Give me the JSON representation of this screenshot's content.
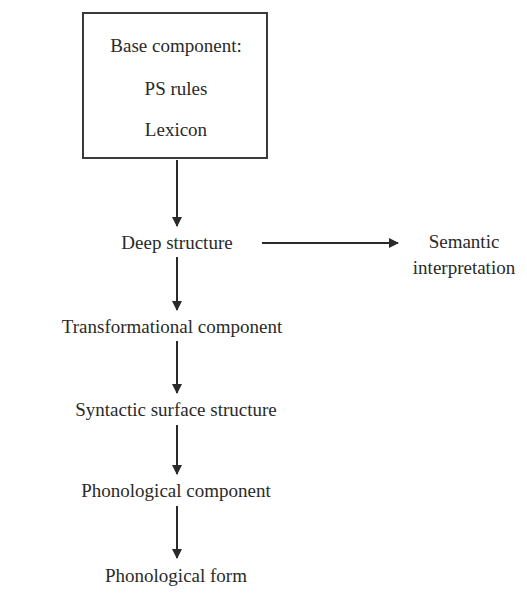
{
  "diagram": {
    "base_box": {
      "title": "Base component:",
      "line1": "PS rules",
      "line2": "Lexicon"
    },
    "nodes": {
      "deep_structure": "Deep structure",
      "semantic_line1": "Semantic",
      "semantic_line2": "interpretation",
      "transformational": "Transformational component",
      "surface": "Syntactic surface structure",
      "phonological_component": "Phonological component",
      "phonological_form": "Phonological form"
    },
    "colors": {
      "ink": "#2a2a2a",
      "background": "#ffffff"
    }
  }
}
